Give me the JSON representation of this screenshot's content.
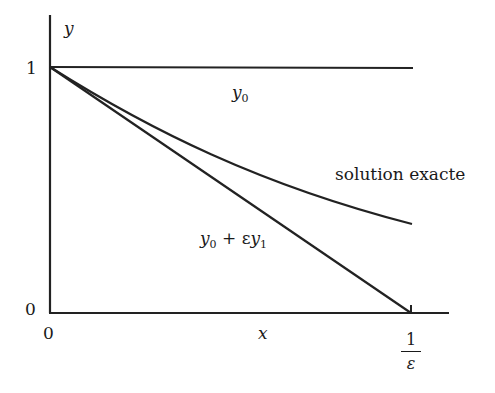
{
  "diagram": {
    "axes": {
      "y_label": "y",
      "x_label": "x",
      "y_tick_top": "1",
      "y_tick_bottom": "0",
      "x_tick_origin": "0",
      "x_tick_end_num": "1",
      "x_tick_end_den": "ε"
    },
    "curves": [
      {
        "name": "y0",
        "label_main": "y",
        "label_sub": "0"
      },
      {
        "name": "exact",
        "label": "solution exacte"
      },
      {
        "name": "first-order",
        "label_main": "y",
        "label_sub": "0",
        "label_mid": " + ε",
        "label_main2": "y",
        "label_sub2": "1"
      }
    ],
    "stroke_color": "#222222"
  }
}
